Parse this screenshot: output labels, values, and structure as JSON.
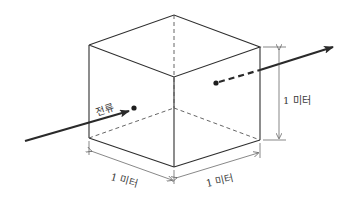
{
  "figure": {
    "labels": {
      "current": "전류",
      "height": "1 미터",
      "depth_left": "1 미터",
      "width_right": "1 미터"
    },
    "colors": {
      "line": "#2e2e2e",
      "background": "#ffffff"
    }
  }
}
